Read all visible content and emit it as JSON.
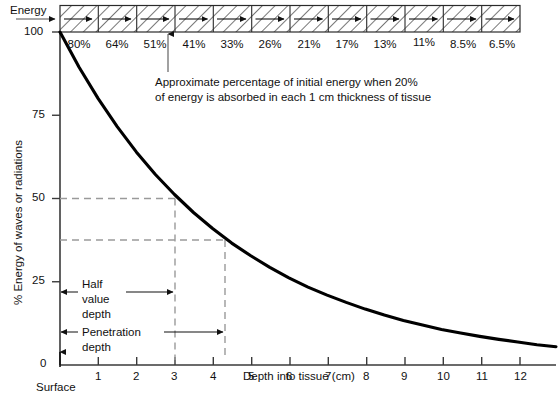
{
  "figure": {
    "energy_label": "Energy",
    "surface_label": "Surface",
    "annotation_line1": "Approximate percentage of initial energy when 20%",
    "annotation_line2": "of energy is absorbed in each 1 cm thickness of tissue",
    "half_value_depth_label_l1": "Half",
    "half_value_depth_label_l2": "value",
    "half_value_depth_label_l3": "depth",
    "penetration_depth_label_l1": "Penetration",
    "penetration_depth_label_l2": "depth"
  },
  "chart_data": {
    "type": "line",
    "title": "",
    "xlabel": "Depth into tissue (cm)",
    "ylabel": "% Energy of waves or radiations",
    "xlim": [
      0,
      13
    ],
    "ylim": [
      0,
      100
    ],
    "grid": false,
    "legend": "none",
    "xticks": [
      1,
      2,
      3,
      4,
      5,
      6,
      7,
      8,
      9,
      10,
      11,
      12
    ],
    "xticklabels": [
      "1",
      "2",
      "3",
      "4",
      "5",
      "6",
      "7",
      "8",
      "9",
      "10",
      "11",
      "12"
    ],
    "yticks": [
      0,
      25,
      50,
      75,
      100
    ],
    "yticklabels": [
      "0",
      "25",
      "50",
      "75",
      "100"
    ],
    "series": [
      {
        "name": "Remaining energy",
        "x": [
          0,
          0.5,
          1,
          1.5,
          2,
          2.5,
          3,
          3.5,
          4,
          4.5,
          5,
          5.5,
          6,
          6.5,
          7,
          7.5,
          8,
          8.5,
          9,
          9.5,
          10,
          10.5,
          11,
          11.5,
          12,
          12.5,
          13
        ],
        "values": [
          100,
          89.4,
          80,
          71.6,
          64,
          57.2,
          51.2,
          45.8,
          41,
          36.6,
          32.8,
          29.3,
          26.2,
          23.4,
          21,
          18.8,
          16.8,
          15,
          13.4,
          12,
          10.7,
          9.6,
          8.6,
          7.7,
          6.9,
          6.1,
          5.5
        ]
      }
    ],
    "absorption_per_cm_percent": 20,
    "band_cells": [
      {
        "depth_cm": 1,
        "label": "80%",
        "value": 80
      },
      {
        "depth_cm": 2,
        "label": "64%",
        "value": 64
      },
      {
        "depth_cm": 3,
        "label": "51%",
        "value": 51
      },
      {
        "depth_cm": 4,
        "label": "41%",
        "value": 41
      },
      {
        "depth_cm": 5,
        "label": "33%",
        "value": 33
      },
      {
        "depth_cm": 6,
        "label": "26%",
        "value": 26
      },
      {
        "depth_cm": 7,
        "label": "21%",
        "value": 21
      },
      {
        "depth_cm": 8,
        "label": "17%",
        "value": 17
      },
      {
        "depth_cm": 9,
        "label": "13%",
        "value": 13
      },
      {
        "depth_cm": 10,
        "label": "11%",
        "value": 11
      },
      {
        "depth_cm": 11,
        "label": "8.5%",
        "value": 8.5
      },
      {
        "depth_cm": 12,
        "label": "6.5%",
        "value": 6.5
      }
    ],
    "annotations": [
      {
        "name": "half-value-depth",
        "depth_cm": 3,
        "energy_percent": 50
      },
      {
        "name": "penetration-depth",
        "depth_cm": 4.3,
        "energy_percent": 37.5
      }
    ]
  },
  "colors": {
    "ink": "#111111",
    "curve": "#000000",
    "dashed": "#9a9a9a",
    "axis": "#3a3a3a",
    "hatch": "#4a4a4a"
  }
}
